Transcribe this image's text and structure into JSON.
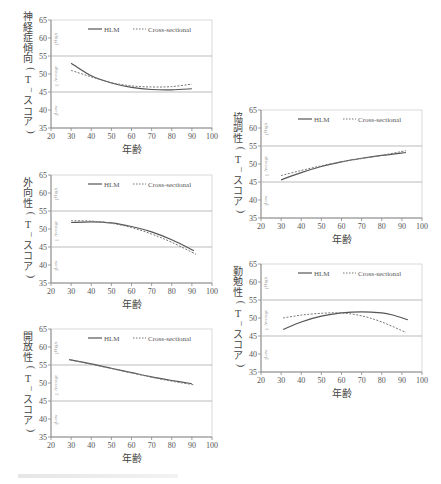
{
  "chart_data": [
    {
      "type": "line",
      "id": "neuroticism",
      "ylabel": "神経症傾向(T-スコア)",
      "xlabel": "年齢",
      "xlim": [
        20,
        100
      ],
      "ylim": [
        35,
        65
      ],
      "xticks": [
        20,
        30,
        40,
        50,
        60,
        70,
        80,
        90,
        100
      ],
      "yticks": [
        35,
        40,
        45,
        50,
        55,
        60,
        65
      ],
      "bands": [
        {
          "label": "High",
          "y": 60
        },
        {
          "label": "Average",
          "y": 50
        },
        {
          "label": "Low",
          "y": 40
        }
      ],
      "reference_lines": [
        45,
        55
      ],
      "legend": [
        "HLM",
        "Cross-sectional"
      ],
      "series": [
        {
          "name": "HLM",
          "style": "solid",
          "x": [
            30,
            40,
            50,
            60,
            70,
            80,
            90
          ],
          "values": [
            53.0,
            49.5,
            47.5,
            46.3,
            45.7,
            45.6,
            45.9
          ]
        },
        {
          "name": "Cross-sectional",
          "style": "dotted",
          "x": [
            30,
            40,
            50,
            60,
            70,
            80,
            90
          ],
          "values": [
            51.0,
            49.2,
            47.6,
            46.7,
            46.4,
            46.5,
            47.2
          ]
        }
      ]
    },
    {
      "type": "line",
      "id": "extraversion",
      "ylabel": "外向性(T-スコア)",
      "xlabel": "年齢",
      "xlim": [
        20,
        100
      ],
      "ylim": [
        35,
        65
      ],
      "xticks": [
        20,
        30,
        40,
        50,
        60,
        70,
        80,
        90,
        100
      ],
      "yticks": [
        35,
        40,
        45,
        50,
        55,
        60,
        65
      ],
      "bands": [
        {
          "label": "High",
          "y": 60
        },
        {
          "label": "Average",
          "y": 50
        },
        {
          "label": "Low",
          "y": 40
        }
      ],
      "reference_lines": [
        45,
        55
      ],
      "legend": [
        "HLM",
        "Cross-sectional"
      ],
      "series": [
        {
          "name": "HLM",
          "style": "solid",
          "x": [
            30,
            40,
            50,
            60,
            70,
            80,
            91
          ],
          "values": [
            51.8,
            52.0,
            51.7,
            50.7,
            49.2,
            47.0,
            44.0
          ]
        },
        {
          "name": "Cross-sectional",
          "style": "dotted",
          "x": [
            30,
            40,
            50,
            60,
            70,
            80,
            92
          ],
          "values": [
            52.3,
            52.2,
            51.6,
            50.4,
            48.6,
            46.3,
            43.0
          ]
        }
      ]
    },
    {
      "type": "line",
      "id": "openness",
      "ylabel": "開放性(T-スコア)",
      "xlabel": "年齢",
      "xlim": [
        20,
        100
      ],
      "ylim": [
        35,
        65
      ],
      "xticks": [
        20,
        30,
        40,
        50,
        60,
        70,
        80,
        90,
        100
      ],
      "yticks": [
        35,
        40,
        45,
        50,
        55,
        60,
        65
      ],
      "bands": [
        {
          "label": "High",
          "y": 60
        },
        {
          "label": "Average",
          "y": 50
        },
        {
          "label": "Low",
          "y": 40
        }
      ],
      "reference_lines": [
        45,
        55
      ],
      "legend": [
        "HLM",
        "Cross-sectional"
      ],
      "series": [
        {
          "name": "HLM",
          "style": "solid",
          "x": [
            29,
            40,
            50,
            60,
            70,
            80,
            90
          ],
          "values": [
            56.5,
            55.3,
            54.1,
            52.9,
            51.7,
            50.7,
            49.8
          ]
        },
        {
          "name": "Cross-sectional",
          "style": "dotted",
          "x": [
            30,
            40,
            50,
            60,
            70,
            80,
            91
          ],
          "values": [
            56.4,
            55.2,
            54.0,
            52.8,
            51.6,
            50.5,
            49.5
          ]
        }
      ]
    },
    {
      "type": "line",
      "id": "agreeableness",
      "ylabel": "協調性(T-スコア)",
      "xlabel": "年齢",
      "xlim": [
        20,
        100
      ],
      "ylim": [
        35,
        65
      ],
      "xticks": [
        20,
        30,
        40,
        50,
        60,
        70,
        80,
        90,
        100
      ],
      "yticks": [
        35,
        40,
        45,
        50,
        55,
        60,
        65
      ],
      "bands": [
        {
          "label": "High",
          "y": 60
        },
        {
          "label": "Average",
          "y": 50
        },
        {
          "label": "Low",
          "y": 40
        }
      ],
      "reference_lines": [
        45,
        55
      ],
      "legend": [
        "HLM",
        "Cross-sectional"
      ],
      "series": [
        {
          "name": "HLM",
          "style": "solid",
          "x": [
            30,
            40,
            50,
            60,
            70,
            80,
            92
          ],
          "values": [
            45.6,
            47.6,
            49.3,
            50.6,
            51.6,
            52.4,
            53.2
          ]
        },
        {
          "name": "Cross-sectional",
          "style": "dotted",
          "x": [
            30,
            40,
            50,
            60,
            70,
            80,
            92
          ],
          "values": [
            46.8,
            48.2,
            49.5,
            50.6,
            51.5,
            52.4,
            53.7
          ]
        }
      ]
    },
    {
      "type": "line",
      "id": "conscientiousness",
      "ylabel": "勤勉性(T-スコア)",
      "xlabel": "年齢",
      "xlim": [
        20,
        100
      ],
      "ylim": [
        35,
        65
      ],
      "xticks": [
        20,
        30,
        40,
        50,
        60,
        70,
        80,
        90,
        100
      ],
      "yticks": [
        35,
        40,
        45,
        50,
        55,
        60,
        65
      ],
      "bands": [
        {
          "label": "High",
          "y": 60
        },
        {
          "label": "Average",
          "y": 50
        },
        {
          "label": "Low",
          "y": 40
        }
      ],
      "reference_lines": [
        45,
        55
      ],
      "legend": [
        "HLM",
        "Cross-sectional"
      ],
      "series": [
        {
          "name": "HLM",
          "style": "solid",
          "x": [
            31,
            40,
            50,
            60,
            70,
            80,
            85,
            93
          ],
          "values": [
            46.8,
            48.9,
            50.5,
            51.4,
            51.7,
            51.4,
            50.9,
            49.5
          ]
        },
        {
          "name": "Cross-sectional",
          "style": "dotted",
          "x": [
            31,
            40,
            50,
            60,
            70,
            80,
            92
          ],
          "values": [
            50.0,
            50.8,
            51.3,
            51.4,
            50.6,
            48.9,
            46.0
          ]
        }
      ]
    }
  ],
  "panels": [
    {
      "id": "neuroticism",
      "left": 0,
      "top": 0
    },
    {
      "id": "extraversion",
      "left": 0,
      "top": 155
    },
    {
      "id": "openness",
      "left": 0,
      "top": 309
    },
    {
      "id": "agreeableness",
      "left": 210,
      "top": 90
    },
    {
      "id": "conscientiousness",
      "left": 210,
      "top": 244
    }
  ],
  "colors": {
    "axis": "#888888",
    "text": "#555555",
    "hlm_line": "#555555",
    "cross_line": "#777777",
    "reference": "#bbbbbb",
    "band_label": "#999999"
  }
}
